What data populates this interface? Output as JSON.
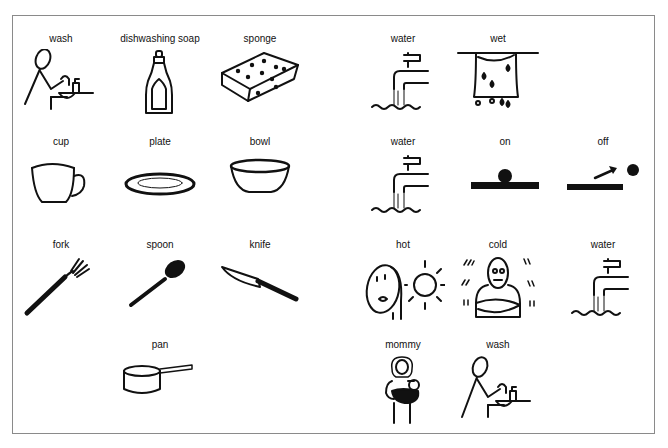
{
  "board": {
    "left_panel": [
      {
        "label": "wash",
        "icon": "washing-dishes-icon"
      },
      {
        "label": "dishwashing soap",
        "icon": "soap-bottle-icon"
      },
      {
        "label": "sponge",
        "icon": "sponge-icon"
      },
      {
        "label": "cup",
        "icon": "cup-icon"
      },
      {
        "label": "plate",
        "icon": "plate-icon"
      },
      {
        "label": "bowl",
        "icon": "bowl-icon"
      },
      {
        "label": "fork",
        "icon": "fork-icon"
      },
      {
        "label": "spoon",
        "icon": "spoon-icon"
      },
      {
        "label": "knife",
        "icon": "knife-icon"
      },
      {
        "label": "pan",
        "icon": "pan-icon"
      }
    ],
    "right_panel": [
      {
        "label": "water",
        "icon": "faucet-icon"
      },
      {
        "label": "wet",
        "icon": "wet-cloth-icon"
      },
      {
        "label": "water",
        "icon": "faucet-icon"
      },
      {
        "label": "on",
        "icon": "switch-on-icon"
      },
      {
        "label": "off",
        "icon": "switch-off-icon"
      },
      {
        "label": "hot",
        "icon": "hot-person-sun-icon"
      },
      {
        "label": "cold",
        "icon": "cold-shivering-person-icon"
      },
      {
        "label": "water",
        "icon": "faucet-icon"
      },
      {
        "label": "mommy",
        "icon": "mother-holding-baby-icon"
      },
      {
        "label": "wash",
        "icon": "washing-dishes-icon"
      }
    ]
  }
}
